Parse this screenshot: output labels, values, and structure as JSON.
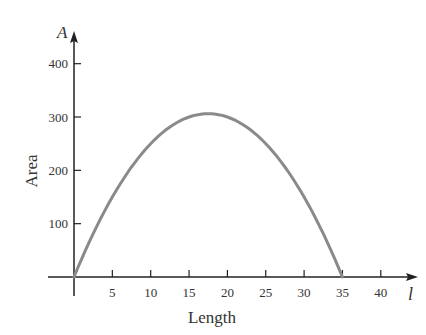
{
  "chart_data": {
    "type": "line",
    "title": "",
    "xlabel": "Length",
    "ylabel": "Area",
    "x_axis_variable": "l",
    "y_axis_variable": "A",
    "xlim": [
      0,
      44
    ],
    "ylim": [
      0,
      440
    ],
    "x_ticks": [
      5,
      10,
      15,
      20,
      25,
      30,
      35,
      40
    ],
    "y_ticks": [
      100,
      200,
      300,
      400
    ],
    "grid": false,
    "series": [
      {
        "name": "A = l(35 - l)",
        "x": [
          0,
          2.5,
          5,
          7.5,
          10,
          12.5,
          15,
          17.5,
          20,
          22.5,
          25,
          27.5,
          30,
          32.5,
          35
        ],
        "values": [
          0,
          81.25,
          150,
          206.25,
          250,
          281.25,
          300,
          306.25,
          300,
          281.25,
          250,
          206.25,
          150,
          81.25,
          0
        ]
      }
    ],
    "colors": {
      "curve": "#8a8a8a",
      "axis": "#222222"
    }
  }
}
